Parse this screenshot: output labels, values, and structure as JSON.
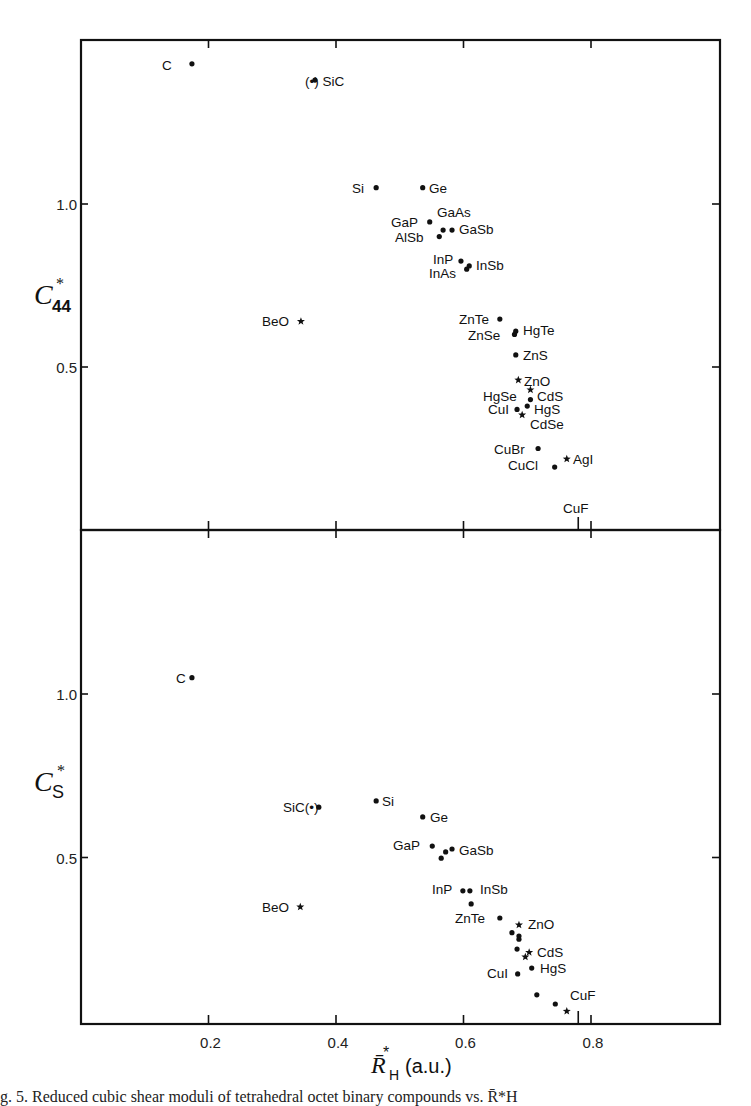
{
  "figure": {
    "caption": "g. 5.   Reduced cubic shear moduli of tetrahedral octet binary compounds vs. R̄*H"
  },
  "chart_data": [
    {
      "type": "scatter",
      "panel": "upper",
      "title": "",
      "xlabel": "R̄*H (a.u.)",
      "ylabel": "C*44",
      "xlim": [
        0.0,
        1.0
      ],
      "ylim": [
        0.0,
        1.5
      ],
      "x_ticks": [
        0.2,
        0.4,
        0.6,
        0.8
      ],
      "y_ticks": [
        0.5,
        1.0
      ],
      "y_tick_labels": [
        "0.5",
        "1.0"
      ],
      "grid": false,
      "legend": "none",
      "marker_key": {
        "dot": "zinc-blende / diamond",
        "star": "wurtzite"
      },
      "points": [
        {
          "label": "C",
          "x": 0.174,
          "y": 1.43,
          "marker": "dot"
        },
        {
          "label": "SiC",
          "x": 0.367,
          "y": 1.38,
          "marker": "dot-paren"
        },
        {
          "label": "Si",
          "x": 0.463,
          "y": 1.05,
          "marker": "dot"
        },
        {
          "label": "Ge",
          "x": 0.536,
          "y": 1.05,
          "marker": "dot"
        },
        {
          "label": "GaP",
          "x": 0.547,
          "y": 0.945,
          "marker": "dot"
        },
        {
          "label": "GaAs",
          "x": 0.568,
          "y": 0.92,
          "marker": "dot"
        },
        {
          "label": "GaSb",
          "x": 0.582,
          "y": 0.92,
          "marker": "dot"
        },
        {
          "label": "AlSb",
          "x": 0.562,
          "y": 0.9,
          "marker": "dot"
        },
        {
          "label": "InP",
          "x": 0.596,
          "y": 0.825,
          "marker": "dot"
        },
        {
          "label": "InAs",
          "x": 0.605,
          "y": 0.8,
          "marker": "dot"
        },
        {
          "label": "InSb",
          "x": 0.609,
          "y": 0.81,
          "marker": "dot"
        },
        {
          "label": "BeO",
          "x": 0.345,
          "y": 0.64,
          "marker": "star"
        },
        {
          "label": "ZnTe",
          "x": 0.657,
          "y": 0.647,
          "marker": "dot"
        },
        {
          "label": "ZnSe",
          "x": 0.68,
          "y": 0.6,
          "marker": "dot"
        },
        {
          "label": "HgTe",
          "x": 0.682,
          "y": 0.61,
          "marker": "dot"
        },
        {
          "label": "ZnS",
          "x": 0.682,
          "y": 0.537,
          "marker": "dot"
        },
        {
          "label": "ZnO",
          "x": 0.686,
          "y": 0.46,
          "marker": "star"
        },
        {
          "label": "CdS",
          "x": 0.705,
          "y": 0.43,
          "marker": "star"
        },
        {
          "label": "HgSe",
          "x": 0.705,
          "y": 0.4,
          "marker": "dot"
        },
        {
          "label": "CuI",
          "x": 0.684,
          "y": 0.37,
          "marker": "dot"
        },
        {
          "label": "HgS",
          "x": 0.7,
          "y": 0.38,
          "marker": "dot"
        },
        {
          "label": "CdSe",
          "x": 0.692,
          "y": 0.353,
          "marker": "star"
        },
        {
          "label": "CuBr",
          "x": 0.717,
          "y": 0.25,
          "marker": "dot"
        },
        {
          "label": "CuCl",
          "x": 0.743,
          "y": 0.193,
          "marker": "dot"
        },
        {
          "label": "AgI",
          "x": 0.762,
          "y": 0.218,
          "marker": "star"
        },
        {
          "label": "CuF",
          "x": 0.78,
          "y": 0.0,
          "marker": "axis-mark"
        }
      ]
    },
    {
      "type": "scatter",
      "panel": "lower",
      "title": "",
      "xlabel": "R̄*H (a.u.)",
      "ylabel": "C*S",
      "xlim": [
        0.0,
        1.0
      ],
      "ylim": [
        0.0,
        1.5
      ],
      "x_ticks": [
        0.2,
        0.4,
        0.6,
        0.8
      ],
      "x_tick_labels": [
        "0.2",
        "0.4",
        "0.6",
        "0.8"
      ],
      "y_ticks": [
        0.5,
        1.0
      ],
      "y_tick_labels": [
        "0.5",
        "1.0"
      ],
      "grid": false,
      "legend": "none",
      "points": [
        {
          "label": "C",
          "x": 0.174,
          "y": 1.05,
          "marker": "dot"
        },
        {
          "label": "SiC",
          "x": 0.373,
          "y": 0.654,
          "marker": "dot-paren"
        },
        {
          "label": "Si",
          "x": 0.463,
          "y": 0.673,
          "marker": "dot"
        },
        {
          "label": "Ge",
          "x": 0.536,
          "y": 0.624,
          "marker": "dot"
        },
        {
          "label": "GaP",
          "x": 0.551,
          "y": 0.535,
          "marker": "dot"
        },
        {
          "label": "GaAs",
          "x": 0.572,
          "y": 0.517,
          "marker": "dot"
        },
        {
          "label": "GaSb",
          "x": 0.582,
          "y": 0.526,
          "marker": "dot"
        },
        {
          "label": "AlSb",
          "x": 0.565,
          "y": 0.498,
          "marker": "dot"
        },
        {
          "label": "InP",
          "x": 0.599,
          "y": 0.398,
          "marker": "dot"
        },
        {
          "label": "InSb",
          "x": 0.61,
          "y": 0.398,
          "marker": "dot"
        },
        {
          "label": "InAs",
          "x": 0.612,
          "y": 0.358,
          "marker": "dot"
        },
        {
          "label": "BeO",
          "x": 0.344,
          "y": 0.349,
          "marker": "star"
        },
        {
          "label": "ZnTe",
          "x": 0.657,
          "y": 0.315,
          "marker": "dot"
        },
        {
          "label": "ZnO",
          "x": 0.687,
          "y": 0.294,
          "marker": "star"
        },
        {
          "label": "ZnSe",
          "x": 0.676,
          "y": 0.27,
          "marker": "dot"
        },
        {
          "label": "HgTe",
          "x": 0.687,
          "y": 0.26,
          "marker": "dot"
        },
        {
          "label": "HgSe",
          "x": 0.687,
          "y": 0.25,
          "marker": "dot"
        },
        {
          "label": "ZnS",
          "x": 0.684,
          "y": 0.22,
          "marker": "dot"
        },
        {
          "label": "CdS",
          "x": 0.703,
          "y": 0.21,
          "marker": "star"
        },
        {
          "label": "CdSe",
          "x": 0.697,
          "y": 0.196,
          "marker": "star"
        },
        {
          "label": "HgS",
          "x": 0.707,
          "y": 0.162,
          "marker": "dot"
        },
        {
          "label": "CuI",
          "x": 0.685,
          "y": 0.144,
          "marker": "dot"
        },
        {
          "label": "CuBr",
          "x": 0.715,
          "y": 0.08,
          "marker": "dot"
        },
        {
          "label": "CuCl",
          "x": 0.744,
          "y": 0.052,
          "marker": "dot"
        },
        {
          "label": "AgI",
          "x": 0.762,
          "y": 0.03,
          "marker": "star"
        },
        {
          "label": "CuF",
          "x": 0.78,
          "y": 0.0,
          "marker": "axis-mark"
        }
      ]
    }
  ],
  "labels": {
    "upper": [
      {
        "text": "C",
        "px": 162,
        "py": 70,
        "anchor": "start"
      },
      {
        "text": "(•) SiC",
        "px": 305,
        "py": 86,
        "anchor": "start"
      },
      {
        "text": "Si",
        "px": 352,
        "py": 193,
        "anchor": "start"
      },
      {
        "text": "Ge",
        "px": 429,
        "py": 193,
        "anchor": "start"
      },
      {
        "text": "GaP",
        "px": 391,
        "py": 227,
        "anchor": "start"
      },
      {
        "text": "GaAs",
        "px": 437,
        "py": 217,
        "anchor": "start"
      },
      {
        "text": "GaSb",
        "px": 459,
        "py": 234,
        "anchor": "start"
      },
      {
        "text": "AlSb",
        "px": 395,
        "py": 242,
        "anchor": "start"
      },
      {
        "text": "InP",
        "px": 433,
        "py": 264,
        "anchor": "start"
      },
      {
        "text": "InAs",
        "px": 429,
        "py": 278,
        "anchor": "start"
      },
      {
        "text": "InSb",
        "px": 476,
        "py": 270,
        "anchor": "start"
      },
      {
        "text": "BeO",
        "px": 262,
        "py": 326,
        "anchor": "start"
      },
      {
        "text": "ZnTe",
        "px": 459,
        "py": 324,
        "anchor": "start"
      },
      {
        "text": "ZnSe",
        "px": 468,
        "py": 340,
        "anchor": "start"
      },
      {
        "text": "HgTe",
        "px": 523,
        "py": 335,
        "anchor": "start"
      },
      {
        "text": "ZnS",
        "px": 523,
        "py": 360,
        "anchor": "start"
      },
      {
        "text": "ZnO",
        "px": 524,
        "py": 386,
        "anchor": "start"
      },
      {
        "text": "HgSe",
        "px": 483,
        "py": 401,
        "anchor": "start"
      },
      {
        "text": "CdS",
        "px": 537,
        "py": 401,
        "anchor": "start"
      },
      {
        "text": "CuI",
        "px": 488,
        "py": 414,
        "anchor": "start"
      },
      {
        "text": "HgS",
        "px": 534,
        "py": 414,
        "anchor": "start"
      },
      {
        "text": "CdSe",
        "px": 530,
        "py": 429,
        "anchor": "start"
      },
      {
        "text": "CuBr",
        "px": 494,
        "py": 454,
        "anchor": "start"
      },
      {
        "text": "CuCl",
        "px": 508,
        "py": 470,
        "anchor": "start"
      },
      {
        "text": "AgI",
        "px": 573,
        "py": 464,
        "anchor": "start"
      },
      {
        "text": "CuF",
        "px": 563,
        "py": 513,
        "anchor": "start"
      }
    ],
    "lower": [
      {
        "text": "C",
        "px": 176,
        "py": 683,
        "anchor": "start"
      },
      {
        "text": "SiC(•)",
        "px": 283,
        "py": 812,
        "anchor": "start"
      },
      {
        "text": "Si",
        "px": 382,
        "py": 806,
        "anchor": "start"
      },
      {
        "text": "Ge",
        "px": 430,
        "py": 822,
        "anchor": "start"
      },
      {
        "text": "GaP",
        "px": 393,
        "py": 850,
        "anchor": "start"
      },
      {
        "text": "GaSb",
        "px": 459,
        "py": 855,
        "anchor": "start"
      },
      {
        "text": "InP",
        "px": 432,
        "py": 894,
        "anchor": "start"
      },
      {
        "text": "InSb",
        "px": 480,
        "py": 894,
        "anchor": "start"
      },
      {
        "text": "BeO",
        "px": 262,
        "py": 912,
        "anchor": "start"
      },
      {
        "text": "ZnTe",
        "px": 455,
        "py": 923,
        "anchor": "start"
      },
      {
        "text": "ZnO",
        "px": 528,
        "py": 929,
        "anchor": "start"
      },
      {
        "text": "CdS",
        "px": 537,
        "py": 957,
        "anchor": "start"
      },
      {
        "text": "HgS",
        "px": 540,
        "py": 973,
        "anchor": "start"
      },
      {
        "text": "CuI",
        "px": 487,
        "py": 978,
        "anchor": "start"
      },
      {
        "text": "CuF",
        "px": 570,
        "py": 1000,
        "anchor": "start"
      }
    ]
  },
  "axes": {
    "upper_ylabel_main": "C",
    "upper_ylabel_sub": "44",
    "lower_ylabel_main": "C",
    "lower_ylabel_sub": "S",
    "star": "*",
    "xlabel_main": "R̄",
    "xlabel_sub": "H",
    "xlabel_units": "(a.u.)"
  }
}
